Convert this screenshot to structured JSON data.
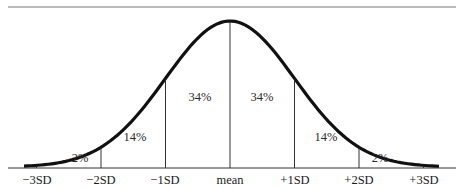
{
  "chart_data": {
    "type": "area",
    "title": "",
    "xlabel": "",
    "ylabel": "",
    "x_ticks": [
      "−3SD",
      "−2SD",
      "−1SD",
      "mean",
      "+1SD",
      "+2SD",
      "+3SD"
    ],
    "x_values": [
      -3,
      -2,
      -1,
      0,
      1,
      2,
      3
    ],
    "regions": [
      {
        "from": "−3SD",
        "to": "−2SD",
        "label": "2%",
        "value": 2
      },
      {
        "from": "−2SD",
        "to": "−1SD",
        "label": "14%",
        "value": 14
      },
      {
        "from": "−1SD",
        "to": "mean",
        "label": "34%",
        "value": 34
      },
      {
        "from": "mean",
        "to": "+1SD",
        "label": "34%",
        "value": 34
      },
      {
        "from": "+1SD",
        "to": "+2SD",
        "label": "14%",
        "value": 14
      },
      {
        "from": "+2SD",
        "to": "+3SD",
        "label": "2%",
        "value": 2
      }
    ],
    "grid": false,
    "legend": null
  },
  "colors": {
    "curve": "#111111",
    "lines": "#333333",
    "background": "#ffffff"
  }
}
